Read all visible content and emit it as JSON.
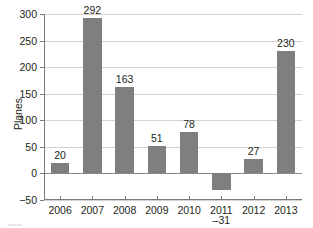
{
  "chart_data": {
    "type": "bar",
    "title": "",
    "xlabel": "",
    "ylabel": "Planes",
    "categories": [
      "2006",
      "2007",
      "2008",
      "2009",
      "2010",
      "2011",
      "2012",
      "2013"
    ],
    "values": [
      20,
      292,
      163,
      51,
      78,
      -31,
      27,
      230
    ],
    "value_labels": [
      "20",
      "292",
      "163",
      "51",
      "78",
      "–31",
      "27",
      "230"
    ],
    "ylim": [
      -50,
      300
    ],
    "yticks": [
      -50,
      0,
      50,
      100,
      150,
      200,
      250,
      300
    ],
    "ytick_labels": [
      "−50",
      "0",
      "50",
      "100",
      "150",
      "200",
      "250",
      "300"
    ],
    "grid": true,
    "legend": false,
    "bar_color": "#7f7f7f",
    "gridline_color": "#d2d2d2",
    "axis_color": "#7a7a7a",
    "text_color": "#231f20"
  }
}
